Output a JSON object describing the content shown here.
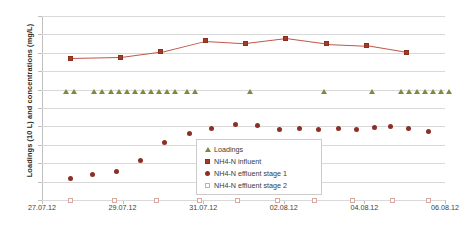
{
  "chart_data": {
    "type": "scatter",
    "title": "",
    "xlabel": "",
    "ylabel": "Loadings (10 L) and concentrations (mg/L)",
    "ylim": [
      0,
      100
    ],
    "ytick_step": 10,
    "yticks": [
      0,
      10,
      20,
      30,
      40,
      50,
      60,
      70,
      80,
      90,
      100
    ],
    "xlim": [
      "27.07.12",
      "06.08.12"
    ],
    "xticks": [
      "27.07.12",
      "29.07.12",
      "31.07.12",
      "02.08.12",
      "04.08.12",
      "06.08.12"
    ],
    "grid": true,
    "legend_position": "center",
    "series": [
      {
        "name": "Loadings",
        "marker": "triangle",
        "color": "#7a8c3a",
        "line": false,
        "points": [
          {
            "x": 0.6,
            "y": 58
          },
          {
            "x": 0.8,
            "y": 58
          },
          {
            "x": 1.3,
            "y": 58
          },
          {
            "x": 1.5,
            "y": 58
          },
          {
            "x": 1.7,
            "y": 58
          },
          {
            "x": 1.9,
            "y": 58
          },
          {
            "x": 2.1,
            "y": 58
          },
          {
            "x": 2.3,
            "y": 58
          },
          {
            "x": 2.5,
            "y": 58
          },
          {
            "x": 2.7,
            "y": 58
          },
          {
            "x": 2.9,
            "y": 58
          },
          {
            "x": 3.1,
            "y": 58
          },
          {
            "x": 3.3,
            "y": 58
          },
          {
            "x": 3.6,
            "y": 58
          },
          {
            "x": 3.8,
            "y": 58
          },
          {
            "x": 5.15,
            "y": 58
          },
          {
            "x": 7.0,
            "y": 58
          },
          {
            "x": 8.2,
            "y": 58
          },
          {
            "x": 8.9,
            "y": 58
          },
          {
            "x": 9.1,
            "y": 58
          },
          {
            "x": 9.3,
            "y": 58
          },
          {
            "x": 9.5,
            "y": 58
          },
          {
            "x": 9.7,
            "y": 58
          },
          {
            "x": 9.9,
            "y": 58
          },
          {
            "x": 10.1,
            "y": 58
          }
        ]
      },
      {
        "name": "NH4-N influent",
        "marker": "square",
        "color": "#a33b26",
        "line": true,
        "line_color": "#c0584a",
        "points": [
          {
            "x": 0.7,
            "y": 77.0
          },
          {
            "x": 1.95,
            "y": 77.5
          },
          {
            "x": 2.95,
            "y": 80.5
          },
          {
            "x": 4.05,
            "y": 86.5
          },
          {
            "x": 5.05,
            "y": 85.3
          },
          {
            "x": 6.05,
            "y": 88.0
          },
          {
            "x": 7.05,
            "y": 85.0
          },
          {
            "x": 8.05,
            "y": 84.0
          },
          {
            "x": 9.05,
            "y": 80.3
          }
        ]
      },
      {
        "name": "NH4-N effluent stage 1",
        "marker": "circle",
        "color": "#8c2f26",
        "line": false,
        "points": [
          {
            "x": 0.7,
            "y": 11.8
          },
          {
            "x": 1.25,
            "y": 13.7
          },
          {
            "x": 1.85,
            "y": 15.5
          },
          {
            "x": 2.45,
            "y": 21.7
          },
          {
            "x": 3.05,
            "y": 31.0
          },
          {
            "x": 3.65,
            "y": 36.2
          },
          {
            "x": 4.2,
            "y": 39.0
          },
          {
            "x": 4.8,
            "y": 41.1
          },
          {
            "x": 5.35,
            "y": 40.3
          },
          {
            "x": 5.9,
            "y": 38.3
          },
          {
            "x": 6.4,
            "y": 38.8
          },
          {
            "x": 6.85,
            "y": 38.5
          },
          {
            "x": 7.35,
            "y": 39.0
          },
          {
            "x": 7.8,
            "y": 38.4
          },
          {
            "x": 8.25,
            "y": 39.2
          },
          {
            "x": 8.65,
            "y": 40.0
          },
          {
            "x": 9.1,
            "y": 38.8
          },
          {
            "x": 9.6,
            "y": 37.5
          }
        ]
      },
      {
        "name": "NH4-N effluent stage 2",
        "marker": "open-square",
        "color": "#ffffff",
        "line": false,
        "points": [
          {
            "x": 0.7,
            "y": 0
          },
          {
            "x": 1.8,
            "y": 0
          },
          {
            "x": 2.85,
            "y": 0
          },
          {
            "x": 3.9,
            "y": 0
          },
          {
            "x": 4.85,
            "y": 0
          },
          {
            "x": 5.85,
            "y": 0
          },
          {
            "x": 6.75,
            "y": 0
          },
          {
            "x": 7.7,
            "y": 0
          },
          {
            "x": 8.7,
            "y": 0
          },
          {
            "x": 9.6,
            "y": 0
          }
        ]
      }
    ]
  },
  "legend": {
    "items": [
      {
        "label": "Loadings",
        "key": "triangle-marker"
      },
      {
        "label": "NH4-N influent",
        "key": "square-marker"
      },
      {
        "label": "NH4-N effluent stage 1",
        "key": "circle-marker"
      },
      {
        "label": "NH4-N effluent stage 2",
        "key": "open-square-marker"
      }
    ]
  }
}
